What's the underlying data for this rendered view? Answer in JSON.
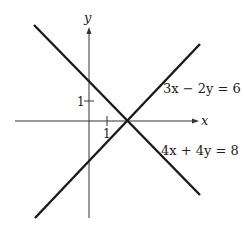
{
  "axes": {
    "x_label": "x",
    "y_label": "y",
    "x_tick_label": "1",
    "y_tick_label": "1"
  },
  "lines": [
    {
      "equation": "3x − 2y = 6",
      "slope": 1.5,
      "intercept": -3
    },
    {
      "equation": "4x + 4y = 8",
      "slope": -1,
      "intercept": 2
    }
  ],
  "intersection": {
    "x": 2,
    "y": 0
  },
  "colors": {
    "line": "#1a1a1a",
    "axis": "#333333"
  }
}
